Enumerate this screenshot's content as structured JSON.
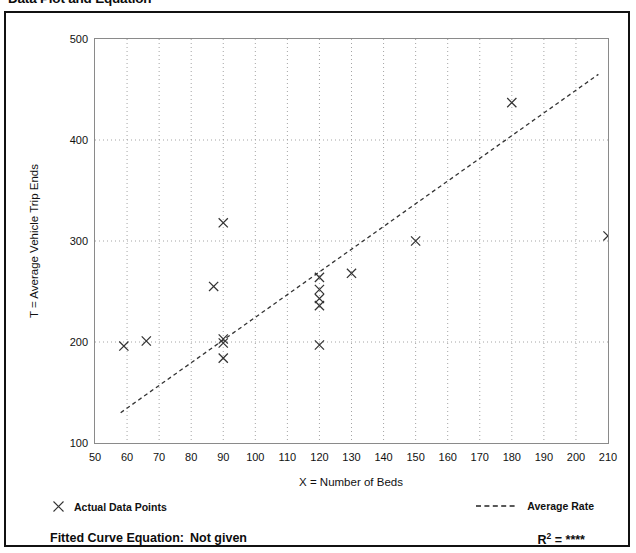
{
  "page": {
    "title": "Data Plot and Equation"
  },
  "legend": {
    "points_label": "Actual Data Points",
    "points_marker": "x-marker-icon",
    "line_label": "Average Rate",
    "line_marker": "dashed-line-icon"
  },
  "footer": {
    "fitted_curve_caption": "Fitted Curve Equation:",
    "fitted_curve_value": "Not given",
    "r_symbol": "R",
    "r_exponent": "2",
    "r_equals": "=",
    "r_value": "****"
  },
  "chart_data": {
    "type": "scatter",
    "title": "Data Plot and Equation",
    "xlabel": "X = Number of Beds",
    "ylabel": "T = Average Vehicle Trip Ends",
    "xlim": [
      50,
      210
    ],
    "ylim": [
      100,
      500
    ],
    "xticks": [
      50,
      60,
      70,
      80,
      90,
      100,
      110,
      120,
      130,
      140,
      150,
      160,
      170,
      180,
      190,
      200,
      210
    ],
    "yticks": [
      100,
      200,
      300,
      400,
      500
    ],
    "y_minor_ticks": [
      150,
      250,
      350,
      450
    ],
    "x_minor_tick_step": 5,
    "grid": true,
    "grid_style": "dotted",
    "legend_position": "below-plot",
    "series": [
      {
        "name": "Actual Data Points",
        "type": "scatter",
        "marker": "x",
        "color": "#333333",
        "points": [
          {
            "x": 59,
            "y": 196
          },
          {
            "x": 66,
            "y": 201
          },
          {
            "x": 87,
            "y": 255
          },
          {
            "x": 90,
            "y": 318
          },
          {
            "x": 90,
            "y": 203
          },
          {
            "x": 90,
            "y": 199
          },
          {
            "x": 90,
            "y": 184
          },
          {
            "x": 120,
            "y": 264
          },
          {
            "x": 120,
            "y": 252
          },
          {
            "x": 120,
            "y": 243
          },
          {
            "x": 120,
            "y": 236
          },
          {
            "x": 120,
            "y": 197
          },
          {
            "x": 130,
            "y": 268
          },
          {
            "x": 150,
            "y": 300
          },
          {
            "x": 180,
            "y": 437
          },
          {
            "x": 210,
            "y": 305
          }
        ]
      },
      {
        "name": "Average Rate",
        "type": "line",
        "style": "dashed",
        "color": "#333333",
        "endpoints": [
          {
            "x": 58,
            "y": 130
          },
          {
            "x": 207,
            "y": 465
          }
        ]
      }
    ]
  }
}
